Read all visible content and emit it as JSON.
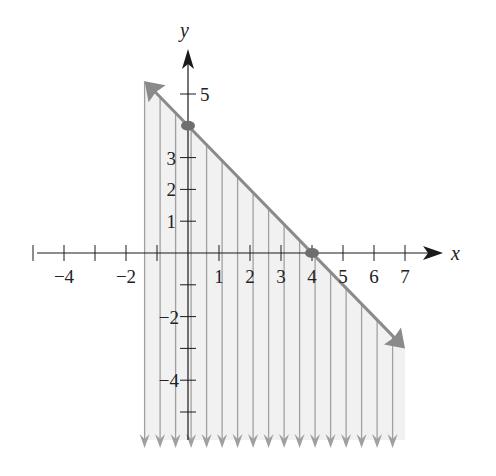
{
  "chart_data": {
    "type": "area",
    "title": "",
    "xlabel": "x",
    "ylabel": "y",
    "xlim": [
      -5,
      8
    ],
    "ylim": [
      -6,
      6
    ],
    "grid": false,
    "x_tick_labels": [
      "-4",
      "-2",
      "1",
      "2",
      "3",
      "4",
      "5",
      "6",
      "7"
    ],
    "x_tick_values": [
      -5,
      -4,
      -3,
      -2,
      -1,
      1,
      2,
      3,
      4,
      5,
      6,
      7
    ],
    "y_tick_labels": [
      "5",
      "3",
      "2",
      "1",
      "-2",
      "-4"
    ],
    "y_tick_values": [
      5,
      3,
      2,
      1,
      -1,
      -2,
      -3,
      -4,
      -5
    ],
    "boundary_line": {
      "equation": "y = -x + 4",
      "slope": -1,
      "intercept": 4,
      "style": "solid",
      "x_range": [
        -1.4,
        7
      ],
      "arrows": "both ends",
      "color": "#8a8a8a"
    },
    "highlighted_points": [
      {
        "x": 0,
        "y": 4,
        "label": "y-intercept"
      },
      {
        "x": 4,
        "y": 0,
        "label": "x-intercept"
      }
    ],
    "shading": {
      "region": "below line",
      "style": "vertical arrows",
      "x_range": [
        -1.4,
        7
      ],
      "spacing": 0.5,
      "color": "#8a8a8a",
      "fill": "#f2f2f2"
    }
  },
  "labels": {
    "x_axis": "x",
    "y_axis": "y",
    "x_ticks": [
      {
        "v": -4,
        "t": "−4"
      },
      {
        "v": -2,
        "t": "−2"
      },
      {
        "v": 1,
        "t": "1"
      },
      {
        "v": 2,
        "t": "2"
      },
      {
        "v": 3,
        "t": "3"
      },
      {
        "v": 4,
        "t": "4"
      },
      {
        "v": 5,
        "t": "5"
      },
      {
        "v": 6,
        "t": "6"
      },
      {
        "v": 7,
        "t": "7"
      }
    ],
    "y_ticks": [
      {
        "v": 5,
        "t": "5"
      },
      {
        "v": 3,
        "t": "3"
      },
      {
        "v": 2,
        "t": "2"
      },
      {
        "v": 1,
        "t": "1"
      },
      {
        "v": -2,
        "t": "−2"
      },
      {
        "v": -4,
        "t": "−4"
      }
    ]
  },
  "colors": {
    "axis": "#1a1a1a",
    "line": "#8c8c8c",
    "shade_fill": "#f1f1f1",
    "shade_line": "#a0a0a0",
    "point": "#6e6e6e"
  }
}
